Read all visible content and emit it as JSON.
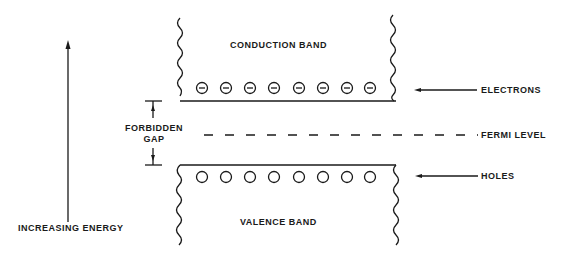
{
  "diagram": {
    "labels": {
      "conduction_band": "CONDUCTION BAND",
      "valence_band": "VALENCE BAND",
      "electrons": "ELECTRONS",
      "fermi_level": "FERMI LEVEL",
      "holes": "HOLES",
      "forbidden_gap_line1": "FORBIDDEN",
      "forbidden_gap_line2": "GAP",
      "increasing_energy": "INCREASING ENERGY"
    },
    "electron_count": 8,
    "hole_count": 8,
    "colors": {
      "ink": "#1a1a1a",
      "background": "#ffffff"
    }
  }
}
